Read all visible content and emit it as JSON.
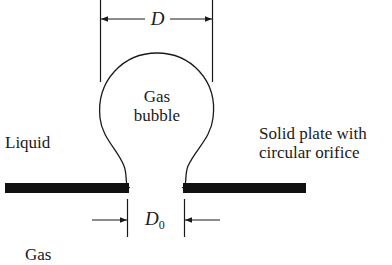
{
  "diagram": {
    "labels": {
      "liquid": "Liquid",
      "gas_bottom": "Gas",
      "bubble_line1": "Gas",
      "bubble_line2": "bubble",
      "plate_line1": "Solid plate with",
      "plate_line2": "circular orifice",
      "bubble_diameter": "D",
      "orifice_diameter_main": "D",
      "orifice_diameter_sub": "0"
    },
    "colors": {
      "ink": "#1a1a1a",
      "plate": "#111111",
      "background": "#ffffff"
    }
  }
}
